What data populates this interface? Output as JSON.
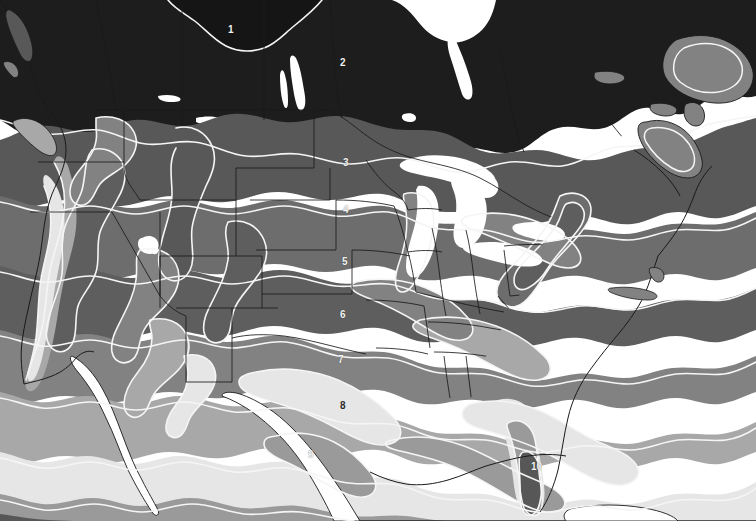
{
  "map": {
    "title": "Plant Hardiness Zone Map of North America",
    "type": "choropleth-contour-map",
    "projection_note": "continental United States with southern Canada and northern Mexico",
    "background_color": "#ffffff",
    "water_color": "#ffffff",
    "border_color": "#1a1a1a",
    "contour_line_color": "#f5f5f5",
    "zone_legend_present": false,
    "zones": [
      {
        "number": "1",
        "fill": "#151515",
        "label_color": "light",
        "x": 231,
        "y": 30,
        "region": "far northern Canada"
      },
      {
        "number": "2",
        "fill": "#1d1d1d",
        "label_color": "light",
        "x": 343,
        "y": 63,
        "region": "northern Canada / Hudson Bay"
      },
      {
        "number": "3",
        "fill": "#585858",
        "label_color": "light",
        "x": 346,
        "y": 163,
        "region": "northern plains / Minnesota"
      },
      {
        "number": "4",
        "fill": "#6d6d6d",
        "label_color": "light",
        "x": 346,
        "y": 210,
        "region": "upper midwest"
      },
      {
        "number": "5",
        "fill": "#5e5e5e",
        "label_color": "light",
        "x": 345,
        "y": 262,
        "region": "Iowa / central midwest"
      },
      {
        "number": "6",
        "fill": "#828282",
        "label_color": "light",
        "x": 343,
        "y": 315,
        "region": "Missouri / Ohio valley"
      },
      {
        "number": "7",
        "fill": "#a8a8a8",
        "label_color": "light",
        "x": 341,
        "y": 360,
        "region": "Oklahoma / mid-south"
      },
      {
        "number": "8",
        "fill": "#e6e6e6",
        "label_color": "dark",
        "x": 343,
        "y": 406,
        "region": "Texas / deep south"
      },
      {
        "number": "9",
        "fill": "#9a9a9a",
        "label_color": "light",
        "x": 311,
        "y": 455,
        "region": "south Texas / Gulf coast"
      },
      {
        "number": "10",
        "fill": "#575757",
        "label_color": "light",
        "x": 535,
        "y": 467,
        "region": "south Florida"
      }
    ]
  }
}
